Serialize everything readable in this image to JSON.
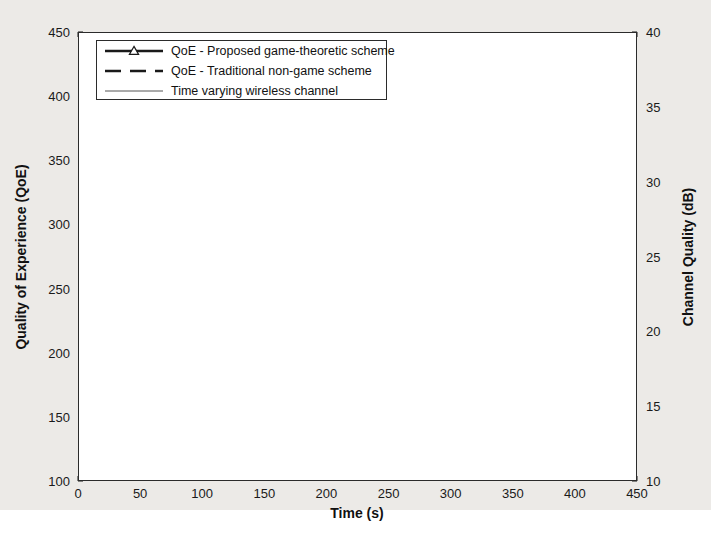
{
  "chart_data": {
    "type": "line",
    "title": "",
    "xlabel": "Time (s)",
    "ylabel": "Quality of Experience (QoE)",
    "y2label": "Channel Quality (dB)",
    "xlim": [
      0,
      450
    ],
    "ylim": [
      100,
      450
    ],
    "y2lim": [
      10,
      40
    ],
    "xticks": [
      0,
      50,
      100,
      150,
      200,
      250,
      300,
      350,
      400,
      450
    ],
    "yticks": [
      100,
      150,
      200,
      250,
      300,
      350,
      400,
      450
    ],
    "y2ticks": [
      10,
      15,
      20,
      25,
      30,
      35,
      40
    ],
    "grid": true,
    "legend_position": "top-left",
    "series": [
      {
        "name": "QoE - Proposed game-theoretic scheme",
        "style": "solid-thick-with-triangle-markers",
        "color": "#1a1a1a",
        "axis": "left",
        "x": [
          2,
          21,
          41,
          61,
          81,
          101,
          121,
          141,
          161,
          181,
          201,
          221,
          241,
          261,
          281,
          301,
          321,
          341,
          361,
          381,
          401
        ],
        "y": [
          268,
          305,
          304,
          305,
          297,
          288,
          295,
          292,
          303,
          308,
          312,
          314,
          315,
          311,
          307,
          299,
          297,
          288,
          290,
          298,
          312
        ]
      },
      {
        "name": "QoE - Traditional non-game scheme",
        "style": "dashed",
        "color": "#1a1a1a",
        "axis": "left",
        "x": [
          1,
          4,
          21,
          41,
          61,
          72,
          81,
          92,
          101,
          112,
          121,
          131,
          141,
          151,
          161,
          171,
          181,
          191,
          201,
          211,
          221,
          231,
          241,
          251,
          261,
          271,
          281,
          291,
          301,
          311,
          321,
          331,
          341,
          346,
          352,
          361,
          366,
          372,
          382,
          386,
          392,
          401
        ],
        "y": [
          103,
          150,
          243,
          344,
          150,
          210,
          281,
          205,
          124,
          140,
          160,
          151,
          138,
          215,
          302,
          206,
          194,
          286,
          374,
          281,
          247,
          196,
          230,
          276,
          356,
          281,
          226,
          233,
          239,
          215,
          190,
          145,
          103,
          124,
          186,
          328,
          186,
          140,
          103,
          128,
          186,
          255
        ]
      },
      {
        "name": "Time varying wireless channel",
        "style": "solid-thin",
        "color": "#555555",
        "axis": "right",
        "x": [
          2,
          21,
          41,
          61,
          81,
          101,
          121,
          141,
          161,
          181,
          201,
          221,
          241,
          261,
          281,
          301,
          321,
          335,
          341,
          356,
          361,
          381,
          401
        ],
        "y": [
          100,
          268,
          380,
          357,
          362,
          250,
          296,
          268,
          347,
          381,
          394,
          409,
          422,
          380,
          353,
          330,
          323,
          277,
          274,
          281,
          299,
          338,
          378
        ]
      }
    ]
  },
  "legend": {
    "items": [
      {
        "label": "QoE - Proposed game-theoretic scheme",
        "marker": "triangle",
        "line": "solid-thick"
      },
      {
        "label": "QoE - Traditional non-game scheme",
        "marker": "none",
        "line": "dashed"
      },
      {
        "label": "Time varying wireless channel",
        "marker": "none",
        "line": "solid-thin"
      }
    ]
  },
  "axes": {
    "x_title": "Time (s)",
    "y_left_title": "Quality of Experience (QoE)",
    "y_right_title": "Channel Quality (dB)"
  }
}
